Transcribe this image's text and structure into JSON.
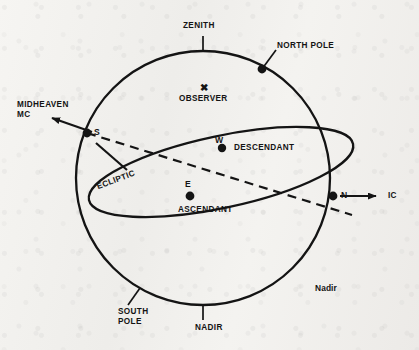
{
  "figure": {
    "background_color": "#f2f1ee",
    "ink_color": "#141414"
  },
  "labels": {
    "zenith": "ZENITH",
    "nadir": "NADIR",
    "north_pole": "NORTH POLE",
    "south_pole": "SOUTH\nPOLE",
    "observer": "OBSERVER",
    "observer_marker": "✖",
    "midheaven": "MIDHEAVEN\nMC",
    "ic": "IC",
    "ecliptic": "ECLIPTIC",
    "descendant": "DESCENDANT",
    "ascendant": "ASCENDANT",
    "nadir_caption": "Nadir",
    "point_s": "S",
    "point_w": "W",
    "point_e": "E",
    "point_n": "N"
  },
  "icon_names": {
    "observer_marker": "cross-marker-icon",
    "mc_arrow": "arrow-left-icon",
    "ic_arrow": "arrow-right-icon"
  },
  "geometry": {
    "horizon_circle": {
      "cx": 203,
      "cy": 178,
      "r": 127
    },
    "ecliptic_ellipse": {
      "cx": 221,
      "cy": 172,
      "rx": 135,
      "ry": 36,
      "rotation_deg": -12
    },
    "points": {
      "south": {
        "x": 87,
        "y": 133
      },
      "west": {
        "x": 222,
        "y": 148
      },
      "east": {
        "x": 190,
        "y": 196
      },
      "north": {
        "x": 333,
        "y": 196
      },
      "north_pole": {
        "x": 262,
        "y": 69
      }
    },
    "mc_arrow_tip": {
      "x": 48,
      "y": 117
    },
    "ic_arrow_tip": {
      "x": 381,
      "y": 196
    }
  }
}
